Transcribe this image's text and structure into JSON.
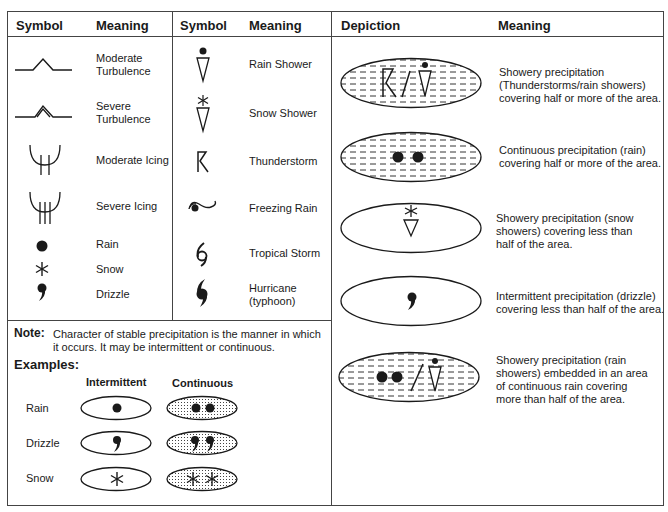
{
  "left_table": {
    "headers": [
      "Symbol",
      "Meaning",
      "Symbol",
      "Meaning"
    ],
    "col1_rows": [
      {
        "icon": "moderate-turbulence-icon",
        "meaning": "Moderate\nTurbulence"
      },
      {
        "icon": "severe-turbulence-icon",
        "meaning": "Severe\nTurbulence"
      },
      {
        "icon": "moderate-icing-icon",
        "meaning": "Moderate Icing"
      },
      {
        "icon": "severe-icing-icon",
        "meaning": "Severe Icing"
      },
      {
        "icon": "rain-icon",
        "meaning": "Rain"
      },
      {
        "icon": "snow-icon",
        "meaning": "Snow"
      },
      {
        "icon": "drizzle-icon",
        "meaning": "Drizzle"
      }
    ],
    "col2_rows": [
      {
        "icon": "rain-shower-icon",
        "meaning": "Rain Shower"
      },
      {
        "icon": "snow-shower-icon",
        "meaning": "Snow Shower"
      },
      {
        "icon": "thunderstorm-icon",
        "meaning": "Thunderstorm"
      },
      {
        "icon": "freezing-rain-icon",
        "meaning": "Freezing Rain"
      },
      {
        "icon": "tropical-storm-icon",
        "meaning": "Tropical Storm"
      },
      {
        "icon": "hurricane-icon",
        "meaning": "Hurricane\n(typhoon)"
      }
    ]
  },
  "note": {
    "label": "Note:",
    "text_line1": "Character of stable precipitation is the manner in which",
    "text_line2": "it occurs. It may be intermittent or continuous."
  },
  "examples": {
    "title": "Examples:",
    "columns": [
      "Intermittent",
      "Continuous"
    ],
    "rows": [
      {
        "label": "Rain",
        "intermittent": "rain-icon",
        "continuous": "two-rain-icons"
      },
      {
        "label": "Drizzle",
        "intermittent": "drizzle-icon",
        "continuous": "two-drizzle-icons"
      },
      {
        "label": "Snow",
        "intermittent": "snow-icon",
        "continuous": "two-snow-icons"
      }
    ]
  },
  "right_table": {
    "headers": [
      "Depiction",
      "Meaning"
    ],
    "rows": [
      {
        "depiction": "thunderstorm-rain-shower-shaded-area",
        "lines": [
          "Showery precipitation",
          "(Thunderstorms/rain showers)",
          "covering half or more of the area."
        ]
      },
      {
        "depiction": "continuous-rain-shaded-area",
        "lines": [
          "Continuous precipitation (rain)",
          "covering half or more of the area."
        ]
      },
      {
        "depiction": "snow-shower-unshaded-area",
        "lines": [
          "Showery precipitation (snow",
          "showers) covering less than",
          "half of the area."
        ]
      },
      {
        "depiction": "drizzle-unshaded-area",
        "lines": [
          "Intermittent precipitation (drizzle)",
          "covering less than half of the area."
        ]
      },
      {
        "depiction": "rain-shower-embedded-shaded-area",
        "lines": [
          "Showery precipitation (rain",
          "showers) embedded in an area",
          "of continuous rain covering",
          "more than half of the area."
        ]
      }
    ]
  },
  "colors": {
    "ink": "#1a1a1a",
    "border": "#444444",
    "background": "#ffffff"
  }
}
